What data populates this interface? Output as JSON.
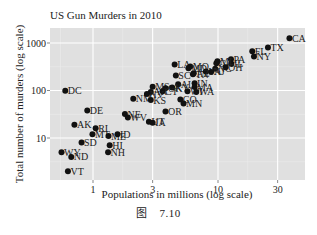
{
  "chart_data": {
    "type": "scatter",
    "title": "US Gun Murders in 2010",
    "xlabel": "Populations in millions (log scale)",
    "ylabel": "Total number of murders (log scale)",
    "x_scale": "log10",
    "y_scale": "log10",
    "x_ticks": [
      1,
      3,
      10,
      30
    ],
    "x_tick_labels": [
      "1",
      "3",
      "10",
      "30"
    ],
    "y_ticks": [
      10,
      100,
      1000
    ],
    "y_tick_labels": [
      "10",
      "100",
      "1000"
    ],
    "xlim": [
      0.5,
      40
    ],
    "ylim": [
      1.5,
      1800
    ],
    "grid": true,
    "legend": "none",
    "points": [
      {
        "label": "CA",
        "x": 37.3,
        "y": 1257
      },
      {
        "label": "TX",
        "x": 25.1,
        "y": 805
      },
      {
        "label": "FL",
        "x": 18.8,
        "y": 669
      },
      {
        "label": "NY",
        "x": 19.4,
        "y": 517
      },
      {
        "label": "PA",
        "x": 12.7,
        "y": 457
      },
      {
        "label": "GA",
        "x": 9.7,
        "y": 376
      },
      {
        "label": "IL",
        "x": 12.8,
        "y": 364
      },
      {
        "label": "MI",
        "x": 9.9,
        "y": 413
      },
      {
        "label": "NC",
        "x": 9.5,
        "y": 286
      },
      {
        "label": "OH",
        "x": 11.5,
        "y": 310
      },
      {
        "label": "LA",
        "x": 4.5,
        "y": 351
      },
      {
        "label": "MO",
        "x": 6.0,
        "y": 321
      },
      {
        "label": "MD",
        "x": 5.8,
        "y": 293
      },
      {
        "label": "TN",
        "x": 6.3,
        "y": 219
      },
      {
        "label": "VA",
        "x": 8.0,
        "y": 250
      },
      {
        "label": "NJ",
        "x": 8.8,
        "y": 246
      },
      {
        "label": "SC",
        "x": 4.6,
        "y": 207
      },
      {
        "label": "AL",
        "x": 4.8,
        "y": 135
      },
      {
        "label": "IN",
        "x": 6.5,
        "y": 142
      },
      {
        "label": "AZ",
        "x": 6.4,
        "y": 232
      },
      {
        "label": "MS",
        "x": 3.0,
        "y": 120
      },
      {
        "label": "OK",
        "x": 3.8,
        "y": 111
      },
      {
        "label": "AR",
        "x": 2.9,
        "y": 93
      },
      {
        "label": "KY",
        "x": 4.3,
        "y": 116
      },
      {
        "label": "CT",
        "x": 3.6,
        "y": 97
      },
      {
        "label": "WI",
        "x": 5.7,
        "y": 97
      },
      {
        "label": "MA",
        "x": 6.5,
        "y": 118
      },
      {
        "label": "WA",
        "x": 6.7,
        "y": 93
      },
      {
        "label": "NM",
        "x": 2.1,
        "y": 67
      },
      {
        "label": "KS",
        "x": 2.9,
        "y": 63
      },
      {
        "label": "NV",
        "x": 2.7,
        "y": 84
      },
      {
        "label": "CO",
        "x": 5.0,
        "y": 65
      },
      {
        "label": "MN",
        "x": 5.3,
        "y": 53
      },
      {
        "label": "OR",
        "x": 3.8,
        "y": 36
      },
      {
        "label": "NE",
        "x": 1.8,
        "y": 32
      },
      {
        "label": "WV",
        "x": 1.9,
        "y": 27
      },
      {
        "label": "UT",
        "x": 2.8,
        "y": 22
      },
      {
        "label": "IA",
        "x": 3.0,
        "y": 21
      },
      {
        "label": "DC",
        "x": 0.6,
        "y": 99
      },
      {
        "label": "DE",
        "x": 0.9,
        "y": 38
      },
      {
        "label": "AK",
        "x": 0.71,
        "y": 19
      },
      {
        "label": "RI",
        "x": 1.05,
        "y": 16
      },
      {
        "label": "MT",
        "x": 0.99,
        "y": 12
      },
      {
        "label": "ME",
        "x": 1.33,
        "y": 11
      },
      {
        "label": "ID",
        "x": 1.57,
        "y": 12
      },
      {
        "label": "SD",
        "x": 0.81,
        "y": 8
      },
      {
        "label": "HI",
        "x": 1.36,
        "y": 7
      },
      {
        "label": "NH",
        "x": 1.32,
        "y": 5
      },
      {
        "label": "WY",
        "x": 0.56,
        "y": 5
      },
      {
        "label": "ND",
        "x": 0.67,
        "y": 4
      },
      {
        "label": "VT",
        "x": 0.63,
        "y": 2
      }
    ]
  },
  "caption": "图　7.10",
  "colors": {
    "panel_bg": "#e0e0e0",
    "grid_major": "#ffffff",
    "grid_minor": "#ececec",
    "point": "#111111",
    "text": "#222222"
  }
}
